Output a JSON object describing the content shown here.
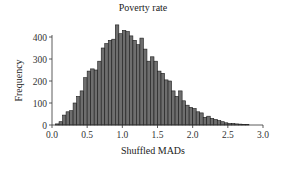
{
  "chart_data": {
    "type": "bar",
    "title": "Poverty rate",
    "xlabel": "Shuffled MADs",
    "ylabel": "Frequency",
    "xlim": [
      0.0,
      3.0
    ],
    "ylim": [
      0,
      450
    ],
    "xticks": [
      "0.0",
      "0.5",
      "1.0",
      "1.5",
      "2.0",
      "2.5",
      "3.0"
    ],
    "yticks": [
      "0",
      "100",
      "200",
      "300",
      "400"
    ],
    "grid": false,
    "bin_width": 0.05,
    "bin_starts": [
      0.05,
      0.1,
      0.15,
      0.2,
      0.25,
      0.3,
      0.35,
      0.4,
      0.45,
      0.5,
      0.55,
      0.6,
      0.65,
      0.7,
      0.75,
      0.8,
      0.85,
      0.9,
      0.95,
      1.0,
      1.05,
      1.1,
      1.15,
      1.2,
      1.25,
      1.3,
      1.35,
      1.4,
      1.45,
      1.5,
      1.55,
      1.6,
      1.65,
      1.7,
      1.75,
      1.8,
      1.85,
      1.9,
      1.95,
      2.0,
      2.05,
      2.1,
      2.15,
      2.2,
      2.25,
      2.3,
      2.35,
      2.4,
      2.45,
      2.5,
      2.55,
      2.6,
      2.65,
      2.7,
      2.75
    ],
    "values": [
      5,
      15,
      45,
      60,
      65,
      100,
      130,
      155,
      215,
      245,
      255,
      250,
      290,
      350,
      370,
      385,
      390,
      455,
      415,
      430,
      425,
      405,
      385,
      365,
      395,
      345,
      290,
      310,
      290,
      245,
      235,
      205,
      200,
      155,
      130,
      155,
      110,
      90,
      80,
      75,
      60,
      55,
      35,
      40,
      30,
      25,
      20,
      15,
      10,
      7,
      7,
      5,
      4,
      3,
      2
    ],
    "bar_color": "#6e6e6e",
    "edge_color": "#1a1a1a"
  }
}
